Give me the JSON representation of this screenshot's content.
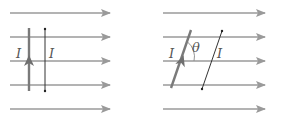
{
  "diagrams": [
    {
      "id": "parallel",
      "field_lines": {
        "x1": 10,
        "x2": 110,
        "ys": [
          13,
          37,
          61,
          85,
          109
        ]
      },
      "wire_thick": {
        "x1": 29,
        "y1": 91,
        "x2": 29,
        "y2": 28,
        "current_label": "I"
      },
      "wire_thin": {
        "x1": 45,
        "y1": 29,
        "x2": 45,
        "y2": 91,
        "current_label": "I"
      }
    },
    {
      "id": "angled",
      "field_lines": {
        "x1": 163,
        "x2": 265,
        "ys": [
          13,
          37,
          61,
          85,
          109
        ]
      },
      "wire_thick": {
        "x1": 171,
        "y1": 88,
        "x2": 191,
        "y2": 30,
        "current_label": "I"
      },
      "wire_thin": {
        "x1": 202,
        "y1": 89,
        "x2": 222,
        "y2": 31,
        "current_label": "I"
      },
      "angle_label": "θ"
    }
  ],
  "colors": {
    "field_line": "#9a9a9a",
    "wire": "#7a7a7a",
    "thin_wire": "#333333",
    "label": "#555555"
  }
}
